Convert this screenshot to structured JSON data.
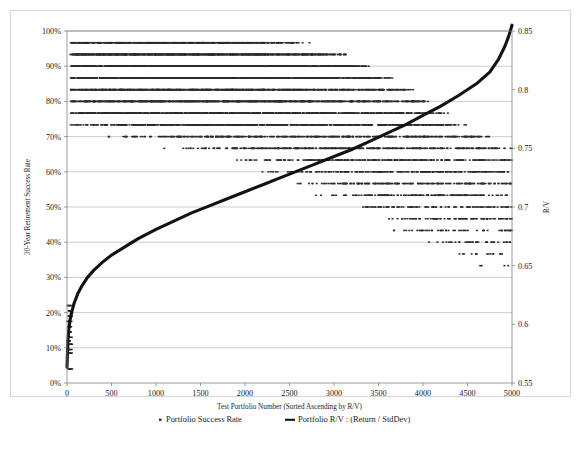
{
  "chart_data": {
    "type": "scatter",
    "title": "",
    "xlabel": "Test Portfolio Number (Sorted Ascending by R/V)",
    "ylabel": "30-Year Retirement Success Rate",
    "y2label": "R/V",
    "xlim": [
      0,
      5000
    ],
    "ylim": [
      0,
      1.0
    ],
    "y2lim": [
      0.55,
      0.85
    ],
    "grid": true,
    "legend_position": "bottom",
    "xticks": [
      0,
      500,
      1000,
      1500,
      2000,
      2500,
      3000,
      3500,
      4000,
      4500,
      5000
    ],
    "xticklabels": [
      "0",
      "500",
      "1000",
      "1500",
      "2000",
      "2500",
      "3000",
      "3500",
      "4000",
      "4500",
      "5000"
    ],
    "yticks": [
      0,
      0.1,
      0.2,
      0.3,
      0.4,
      0.5,
      0.6,
      0.7,
      0.8,
      0.9,
      1.0
    ],
    "yticklabels": [
      "0%",
      "10%",
      "20%",
      "30%",
      "40%",
      "50%",
      "60%",
      "70%",
      "80%",
      "90%",
      "100%"
    ],
    "y2ticks": [
      0.55,
      0.6,
      0.65,
      0.7,
      0.75,
      0.8,
      0.85
    ],
    "y2ticklabels": [
      "0.55",
      "0.6",
      "0.65",
      "0.7",
      "0.75",
      "0.8",
      "0.85"
    ],
    "series": [
      {
        "name": "Portfolio Success Rate",
        "type": "scatter",
        "axis": "left",
        "marker": "square",
        "color": "#2b2b2b",
        "description": "Dense scatter cloud of 5000 portfolios; success rates concentrated between 75% and 97% at low portfolio numbers, spreading downward and thinning to 30%-75% at high portfolio numbers.",
        "band_profile": [
          {
            "x": 100,
            "low": 0.72,
            "high": 0.97,
            "density": 0.55
          },
          {
            "x": 500,
            "low": 0.7,
            "high": 0.97,
            "density": 0.8
          },
          {
            "x": 1000,
            "low": 0.68,
            "high": 0.97,
            "density": 0.9
          },
          {
            "x": 1500,
            "low": 0.66,
            "high": 0.97,
            "density": 0.92
          },
          {
            "x": 2000,
            "low": 0.63,
            "high": 0.97,
            "density": 0.9
          },
          {
            "x": 2500,
            "low": 0.58,
            "high": 0.96,
            "density": 0.82
          },
          {
            "x": 3000,
            "low": 0.52,
            "high": 0.94,
            "density": 0.7
          },
          {
            "x": 3500,
            "low": 0.45,
            "high": 0.88,
            "density": 0.55
          },
          {
            "x": 4000,
            "low": 0.4,
            "high": 0.8,
            "density": 0.42
          },
          {
            "x": 4500,
            "low": 0.34,
            "high": 0.72,
            "density": 0.32
          },
          {
            "x": 5000,
            "low": 0.3,
            "high": 0.66,
            "density": 0.22
          }
        ]
      },
      {
        "name": "Portfolio R/V : (Return / StdDev)",
        "type": "line",
        "axis": "right",
        "color": "#121212",
        "description": "Monotonically increasing sorted R/V curve: steep rise from 0.55 near x=0, near-linear through the middle, steep rise again at the far right to about 0.855.",
        "points": [
          {
            "x": 0,
            "y": 0.5635
          },
          {
            "x": 10,
            "y": 0.586
          },
          {
            "x": 20,
            "y": 0.596
          },
          {
            "x": 35,
            "y": 0.604
          },
          {
            "x": 55,
            "y": 0.611
          },
          {
            "x": 80,
            "y": 0.618
          },
          {
            "x": 120,
            "y": 0.626
          },
          {
            "x": 170,
            "y": 0.633
          },
          {
            "x": 230,
            "y": 0.64
          },
          {
            "x": 300,
            "y": 0.646
          },
          {
            "x": 400,
            "y": 0.653
          },
          {
            "x": 500,
            "y": 0.659
          },
          {
            "x": 650,
            "y": 0.666
          },
          {
            "x": 800,
            "y": 0.673
          },
          {
            "x": 1000,
            "y": 0.681
          },
          {
            "x": 1200,
            "y": 0.688
          },
          {
            "x": 1400,
            "y": 0.695
          },
          {
            "x": 1600,
            "y": 0.701
          },
          {
            "x": 1800,
            "y": 0.707
          },
          {
            "x": 2000,
            "y": 0.713
          },
          {
            "x": 2200,
            "y": 0.719
          },
          {
            "x": 2400,
            "y": 0.725
          },
          {
            "x": 2600,
            "y": 0.731
          },
          {
            "x": 2800,
            "y": 0.737
          },
          {
            "x": 3000,
            "y": 0.743
          },
          {
            "x": 3200,
            "y": 0.749
          },
          {
            "x": 3400,
            "y": 0.756
          },
          {
            "x": 3600,
            "y": 0.763
          },
          {
            "x": 3800,
            "y": 0.77
          },
          {
            "x": 4000,
            "y": 0.778
          },
          {
            "x": 4200,
            "y": 0.786
          },
          {
            "x": 4400,
            "y": 0.795
          },
          {
            "x": 4600,
            "y": 0.805
          },
          {
            "x": 4750,
            "y": 0.815
          },
          {
            "x": 4850,
            "y": 0.826
          },
          {
            "x": 4920,
            "y": 0.837
          },
          {
            "x": 4960,
            "y": 0.845
          },
          {
            "x": 4985,
            "y": 0.851
          },
          {
            "x": 5000,
            "y": 0.855
          }
        ]
      }
    ]
  },
  "legend": {
    "entries": [
      {
        "label": "Portfolio Success Rate",
        "marker": "square",
        "color": "#2b2b2b"
      },
      {
        "label": "Portfolio R/V : (Return / StdDev)",
        "marker": "line",
        "color": "#121212"
      }
    ]
  }
}
